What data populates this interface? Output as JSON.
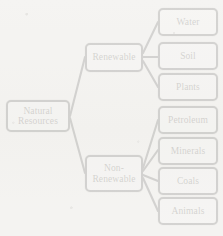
{
  "diagram": {
    "type": "tree",
    "colors": {
      "node_border": "#1a1a1a",
      "node_fill": "#ffffff",
      "background": "#f4f3f1",
      "link": "#1a1a1a",
      "text": "#15130f"
    },
    "root": {
      "label": "Natural\nResources"
    },
    "branches": [
      {
        "label": "Renewable"
      },
      {
        "label": "Non-\nRenewable"
      }
    ],
    "leaves": {
      "renewable": [
        {
          "label": "Water"
        },
        {
          "label": "Soil"
        },
        {
          "label": "Plants"
        }
      ],
      "non_renewable": [
        {
          "label": "Petroleum"
        },
        {
          "label": "Minerals"
        },
        {
          "label": "Coals"
        },
        {
          "label": "Animals"
        }
      ]
    }
  }
}
